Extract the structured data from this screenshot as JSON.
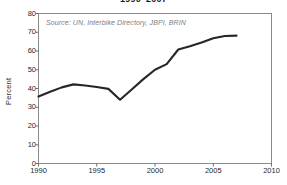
{
  "chart_data": {
    "type": "line",
    "title": "1990–2007",
    "subtitle": "",
    "xlabel": "",
    "ylabel": "Percent",
    "annotation": "Source: UN, Interbike Directory, JBPI, BRIN",
    "grid": false,
    "legend": "none",
    "xlim": [
      1990,
      2010
    ],
    "ylim": [
      0,
      80
    ],
    "xticks": [
      1990,
      1995,
      2000,
      2005,
      2010
    ],
    "xtick_labels": [
      "1990",
      "1995",
      "2000",
      "2005",
      "2010"
    ],
    "yticks": [
      0,
      10,
      20,
      30,
      40,
      50,
      60,
      70,
      80
    ],
    "ytick_labels": [
      "0",
      "10",
      "20",
      "30",
      "40",
      "50",
      "60",
      "70",
      "80"
    ],
    "series": [
      {
        "name": "Percent",
        "color": "#262626",
        "x": [
          1990,
          1991,
          1992,
          1993,
          1994,
          1995,
          1996,
          1997,
          1998,
          1999,
          2000,
          2001,
          2002,
          2003,
          2004,
          2005,
          2006,
          2007
        ],
        "values": [
          35.7,
          38.3,
          40.6,
          42.2,
          41.6,
          40.8,
          39.8,
          34.0,
          39.5,
          45.0,
          50.0,
          53.0,
          60.8,
          62.5,
          64.5,
          66.8,
          68.0,
          68.2
        ]
      }
    ]
  },
  "axis": {
    "y_title": "Percent"
  },
  "colors": {
    "line": "#262626",
    "frame": "#8a8a8a",
    "source_text": "#7d7d7d",
    "tick_text": "#1f1f1f",
    "background": "#ffffff"
  }
}
